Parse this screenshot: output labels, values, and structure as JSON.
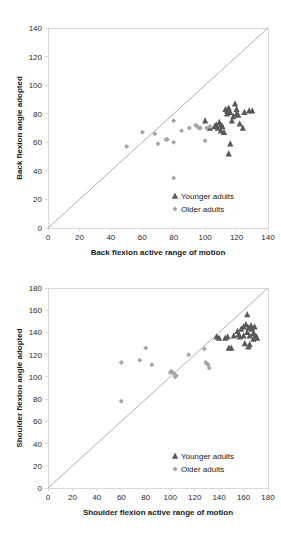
{
  "charts": [
    {
      "id": "back-flexion",
      "chart_data": {
        "type": "scatter",
        "title": "",
        "xlabel": "Back flexion active range of motion",
        "ylabel": "Back flexion angle adopted",
        "xlim": [
          0,
          140
        ],
        "ylim": [
          0,
          140
        ],
        "xticks": [
          0,
          20,
          40,
          60,
          80,
          100,
          120,
          140
        ],
        "yticks": [
          0,
          20,
          40,
          60,
          80,
          100,
          120,
          140
        ],
        "grid": false,
        "legend_position": "lower-right",
        "reference_line": {
          "label": "identity line",
          "from": [
            0,
            0
          ],
          "to": [
            140,
            140
          ]
        },
        "series": [
          {
            "name": "Younger adults",
            "marker": "triangle",
            "color": "#58585a",
            "points": [
              [
                103,
                70
              ],
              [
                106,
                71
              ],
              [
                107,
                72
              ],
              [
                108,
                70
              ],
              [
                109,
                74
              ],
              [
                110,
                72
              ],
              [
                110,
                68
              ],
              [
                112,
                67
              ],
              [
                113,
                83
              ],
              [
                114,
                82
              ],
              [
                114,
                80
              ],
              [
                115,
                84
              ],
              [
                115,
                52
              ],
              [
                116,
                81
              ],
              [
                116,
                59
              ],
              [
                117,
                75
              ],
              [
                118,
                78
              ],
              [
                119,
                87
              ],
              [
                120,
                83
              ],
              [
                120,
                80
              ],
              [
                121,
                79
              ],
              [
                122,
                73
              ],
              [
                124,
                70
              ],
              [
                125,
                81
              ],
              [
                128,
                82
              ],
              [
                130,
                82
              ],
              [
                100,
                75
              ],
              [
                111,
                71
              ]
            ]
          },
          {
            "name": "Older adults",
            "marker": "diamond",
            "color": "#a6a6a6",
            "points": [
              [
                50,
                57
              ],
              [
                60,
                67
              ],
              [
                68,
                66
              ],
              [
                70,
                59
              ],
              [
                75,
                62
              ],
              [
                76,
                62
              ],
              [
                80,
                60
              ],
              [
                80,
                75
              ],
              [
                80,
                35
              ],
              [
                85,
                68
              ],
              [
                90,
                70
              ],
              [
                94,
                72
              ],
              [
                95,
                71
              ],
              [
                96,
                70
              ],
              [
                97,
                70
              ],
              [
                100,
                61
              ],
              [
                101,
                70
              ],
              [
                103,
                71
              ]
            ]
          }
        ]
      }
    },
    {
      "id": "shoulder-flexion",
      "chart_data": {
        "type": "scatter",
        "title": "",
        "xlabel": "Shoulder flexion active range of motion",
        "ylabel": "Shoulder flexion angle adopted",
        "xlim": [
          0,
          180
        ],
        "ylim": [
          0,
          180
        ],
        "xticks": [
          0,
          20,
          40,
          60,
          80,
          100,
          120,
          140,
          160,
          180
        ],
        "yticks": [
          0,
          20,
          40,
          60,
          80,
          100,
          120,
          140,
          160,
          180
        ],
        "grid": false,
        "legend_position": "lower-right",
        "reference_line": {
          "label": "identity line",
          "from": [
            0,
            0
          ],
          "to": [
            180,
            180
          ]
        },
        "series": [
          {
            "name": "Younger adults",
            "marker": "triangle",
            "color": "#58585a",
            "points": [
              [
                138,
                136
              ],
              [
                140,
                135
              ],
              [
                145,
                135
              ],
              [
                147,
                136
              ],
              [
                148,
                126
              ],
              [
                150,
                126
              ],
              [
                152,
                137
              ],
              [
                155,
                141
              ],
              [
                156,
                138
              ],
              [
                157,
                136
              ],
              [
                158,
                143
              ],
              [
                160,
                145
              ],
              [
                160,
                137
              ],
              [
                161,
                130
              ],
              [
                162,
                147
              ],
              [
                163,
                156
              ],
              [
                163,
                140
              ],
              [
                164,
                144
              ],
              [
                165,
                137
              ],
              [
                165,
                129
              ],
              [
                166,
                146
              ],
              [
                167,
                143
              ],
              [
                168,
                139
              ],
              [
                168,
                134
              ],
              [
                169,
                145
              ],
              [
                170,
                137
              ],
              [
                171,
                135
              ],
              [
                164,
                127
              ]
            ]
          },
          {
            "name": "Older adults",
            "marker": "diamond",
            "color": "#a6a6a6",
            "points": [
              [
                60,
                113
              ],
              [
                60,
                78
              ],
              [
                75,
                115
              ],
              [
                80,
                126
              ],
              [
                85,
                111
              ],
              [
                100,
                104
              ],
              [
                101,
                105
              ],
              [
                103,
                103
              ],
              [
                104,
                100
              ],
              [
                105,
                101
              ],
              [
                115,
                120
              ],
              [
                128,
                125
              ],
              [
                130,
                112
              ],
              [
                131,
                111
              ],
              [
                132,
                108
              ],
              [
                129,
                113
              ]
            ]
          }
        ]
      }
    }
  ]
}
